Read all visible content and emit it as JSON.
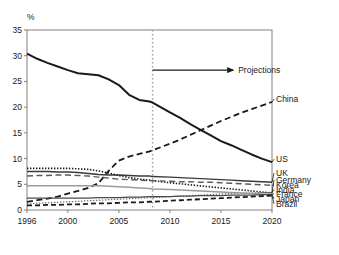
{
  "chart_data": {
    "type": "line",
    "title": "",
    "subtitle": "",
    "xlabel": "",
    "ylabel": "%",
    "y_unit_label": "%",
    "xlim": [
      1996,
      2020
    ],
    "ylim": [
      0,
      35
    ],
    "yticks": [
      0,
      5,
      10,
      15,
      20,
      25,
      30,
      35
    ],
    "ytick_labels": [
      "0",
      "5",
      "10",
      "15",
      "20",
      "25",
      "30",
      "35"
    ],
    "xticks": [
      1996,
      2000,
      2005,
      2010,
      2015,
      2020
    ],
    "xtick_labels": [
      "1996",
      "2000",
      "2005",
      "2010",
      "2015",
      "2020"
    ],
    "grid": false,
    "legend_position": "right-of-axes-inline",
    "annotations": [
      {
        "name": "projections-arrow",
        "label": "Projections",
        "x_start": 2008.3,
        "x_end": 2016.2,
        "y": 27.2,
        "style": "solid-arrow-right"
      },
      {
        "name": "projection-divider",
        "label": "",
        "x": 2008.3,
        "style": "vertical-dotted"
      }
    ],
    "x": [
      1996,
      1997,
      1998,
      1999,
      2000,
      2001,
      2002,
      2003,
      2004,
      2005,
      2006,
      2007,
      2008,
      2008.3,
      2010,
      2011,
      2012,
      2013,
      2014,
      2015,
      2016,
      2017,
      2018,
      2019,
      2020
    ],
    "series": [
      {
        "name": "US",
        "label": "US",
        "style": "solid",
        "color": "#1a1a1a",
        "width": 2.0,
        "label_y": 9.3,
        "values": [
          30.4,
          29.4,
          28.6,
          27.9,
          27.2,
          26.6,
          26.4,
          26.2,
          25.4,
          24.3,
          22.4,
          21.4,
          21.1,
          20.9,
          19.0,
          17.9,
          16.7,
          15.6,
          14.5,
          13.4,
          12.6,
          11.7,
          10.8,
          10.0,
          9.3
        ]
      },
      {
        "name": "China",
        "label": "China",
        "style": "dashed",
        "color": "#1a1a1a",
        "width": 1.8,
        "label_y": 21.0,
        "values": [
          1.6,
          1.9,
          2.2,
          2.6,
          3.2,
          3.7,
          4.3,
          5.2,
          7.6,
          9.6,
          10.4,
          10.9,
          11.4,
          11.6,
          12.9,
          13.7,
          14.6,
          15.5,
          16.4,
          17.3,
          18.1,
          18.9,
          19.6,
          20.3,
          21.0
        ]
      },
      {
        "name": "UK",
        "label": "UK",
        "style": "solid",
        "color": "#3a3a3a",
        "width": 1.4,
        "label_y": 6.6,
        "values": [
          7.5,
          7.5,
          7.5,
          7.4,
          7.4,
          7.3,
          7.1,
          6.9,
          6.8,
          6.8,
          6.7,
          6.6,
          6.6,
          6.5,
          6.4,
          6.3,
          6.2,
          6.1,
          6.0,
          5.9,
          5.8,
          5.7,
          5.6,
          5.5,
          5.4
        ]
      },
      {
        "name": "Germany",
        "label": "Germany",
        "style": "dotted",
        "color": "#1a1a1a",
        "width": 1.6,
        "label_y": 5.3,
        "values": [
          8.1,
          8.1,
          8.1,
          8.1,
          8.1,
          8.0,
          7.9,
          7.6,
          7.2,
          6.7,
          6.3,
          6.0,
          5.8,
          5.7,
          5.3,
          5.1,
          4.9,
          4.7,
          4.5,
          4.3,
          4.1,
          3.9,
          3.7,
          3.5,
          3.3
        ]
      },
      {
        "name": "Korea",
        "label": "Korea",
        "style": "dashed",
        "color": "#5a5a5a",
        "width": 1.4,
        "label_y": 4.3,
        "values": [
          6.6,
          6.7,
          6.7,
          6.8,
          6.8,
          6.7,
          6.6,
          6.4,
          6.2,
          6.0,
          5.9,
          5.8,
          5.7,
          5.7,
          5.6,
          5.5,
          5.5,
          5.4,
          5.4,
          5.3,
          5.2,
          5.1,
          5.0,
          4.9,
          4.8
        ]
      },
      {
        "name": "India",
        "label": "India",
        "style": "dotted",
        "color": "#6a6a6a",
        "width": 1.2,
        "label_y": 3.4,
        "values": [
          1.2,
          1.3,
          1.4,
          1.5,
          1.6,
          1.7,
          1.8,
          1.9,
          2.0,
          2.1,
          2.2,
          2.3,
          2.4,
          2.4,
          2.6,
          2.7,
          2.8,
          2.9,
          3.0,
          3.1,
          3.2,
          3.3,
          3.3,
          3.4,
          3.4
        ]
      },
      {
        "name": "France",
        "label": "France",
        "style": "solid-light",
        "color": "#9a9a9a",
        "width": 1.5,
        "label_y": 2.6,
        "values": [
          4.7,
          4.7,
          4.7,
          4.7,
          4.7,
          4.7,
          4.7,
          4.7,
          4.6,
          4.5,
          4.4,
          4.3,
          4.2,
          4.1,
          4.0,
          3.9,
          3.8,
          3.7,
          3.6,
          3.5,
          3.4,
          3.3,
          3.2,
          3.1,
          3.0
        ]
      },
      {
        "name": "Japan",
        "label": "Japan",
        "style": "solid",
        "color": "#4a4a4a",
        "width": 1.3,
        "label_y": 1.6,
        "values": [
          2.3,
          2.3,
          2.3,
          2.3,
          2.3,
          2.3,
          2.3,
          2.4,
          2.4,
          2.4,
          2.5,
          2.5,
          2.6,
          2.6,
          2.6,
          2.7,
          2.7,
          2.8,
          2.8,
          2.8,
          2.9,
          2.9,
          2.9,
          3.0,
          3.0
        ]
      },
      {
        "name": "Brazil",
        "label": "Brazil",
        "style": "dashed-heavy",
        "color": "#1a1a1a",
        "width": 1.8,
        "label_y": 0.6,
        "values": [
          0.9,
          0.9,
          1.0,
          1.0,
          1.1,
          1.1,
          1.2,
          1.3,
          1.3,
          1.4,
          1.5,
          1.5,
          1.6,
          1.6,
          1.8,
          1.9,
          2.0,
          2.1,
          2.2,
          2.3,
          2.4,
          2.5,
          2.6,
          2.7,
          2.8
        ]
      }
    ]
  },
  "axes": {
    "y_unit": "%",
    "ytick_labels": [
      "35",
      "30",
      "25",
      "20",
      "15",
      "10",
      "5",
      "0"
    ],
    "xtick_labels": [
      "1996",
      "2000",
      "2005",
      "2010",
      "2015",
      "2020"
    ]
  },
  "labels": {
    "china": "China",
    "us": "US",
    "uk": "UK",
    "germany": "Germany",
    "korea": "Korea",
    "india": "India",
    "france": "France",
    "japan": "Japan",
    "brazil": "Brazil",
    "projections": "Projections"
  },
  "colors": {
    "axis": "#808080",
    "text": "#1a1a1a",
    "primary_line": "#1a1a1a",
    "divider": "#9a9a9a",
    "light_line": "#9a9a9a"
  }
}
